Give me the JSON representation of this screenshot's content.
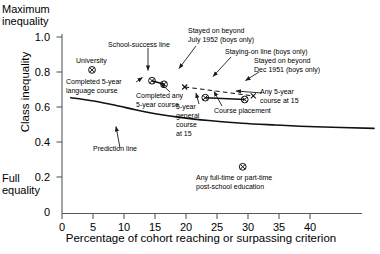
{
  "axes": {
    "top_corner_label": "Maximum\ninequality",
    "bottom_corner_label": "Full\nequality",
    "ylabel": "Class inequality",
    "xlabel": "Percentage of cohort reaching or surpassing criterion",
    "yticks": [
      "1.0",
      "0.8",
      "0.6",
      "0.4",
      "0.2",
      "0"
    ],
    "ytick_values": [
      1.0,
      0.8,
      0.6,
      0.4,
      0.2,
      0
    ],
    "xticks": [
      "0",
      "5",
      "10",
      "15",
      "20",
      "25",
      "30",
      "35",
      "40"
    ],
    "xtick_values": [
      0,
      5,
      10,
      15,
      20,
      25,
      30,
      35,
      40
    ],
    "xlim": [
      0,
      45
    ],
    "ylim": [
      0,
      1.0
    ],
    "grid": "off",
    "axis_color": "#4b5254"
  },
  "annotations": {
    "school_success_line": "School-success line",
    "university": "University",
    "completed_5yr_language": "Completed 5-year\nlanguage course",
    "completed_any_5yr": "Completed any\n5-year course",
    "prediction_line": "Prediction line",
    "stayed_beyond_july_1952": "Stayed on beyond\nJuly 1952 (boys only)",
    "staying_on_line": "Staying-on line (boys only)",
    "stayed_beyond_dec_1951": "Stayed on beyond\nDec 1951 (boys only)",
    "five_year_general_course": "5-year\ngeneral\ncourse\nat 15",
    "course_placement": "Course placement",
    "any_5yr_course_at_15": "Any 5-year\ncourse at 15",
    "post_school_education": "Any full-time or part-time\npost-school education"
  },
  "chart_data": {
    "type": "scatter",
    "title": "",
    "xlabel": "Percentage of cohort reaching or surpassing criterion",
    "ylabel": "Class inequality",
    "xlim": [
      0,
      45
    ],
    "ylim": [
      0,
      1.0
    ],
    "grid": "off",
    "legend_position": "none",
    "points": [
      {
        "label": "University",
        "x": 4.5,
        "y": 0.8,
        "marker": "circled-x"
      },
      {
        "label": "Completed 5-year language course",
        "x": 13.5,
        "y": 0.74,
        "marker": "circled-x"
      },
      {
        "label": "Completed any 5-year course",
        "x": 15.3,
        "y": 0.72,
        "marker": "circled-x"
      },
      {
        "label": "5-year general course at 15",
        "x": 21.5,
        "y": 0.645,
        "marker": "circled-x"
      },
      {
        "label": "Any 5-year course at 15",
        "x": 27.4,
        "y": 0.635,
        "marker": "circled-x"
      },
      {
        "label": "Stayed on beyond July 1952 (boys only)",
        "x": 18.4,
        "y": 0.705,
        "marker": "x"
      },
      {
        "label": "Stayed on beyond Dec 1951 (boys only)",
        "x": 28.7,
        "y": 0.655,
        "marker": "x"
      },
      {
        "label": "Any full-time or part-time post-school education",
        "x": 27.1,
        "y": 0.26,
        "marker": "circled-x"
      }
    ],
    "series": [
      {
        "name": "School-success line",
        "style": "solid",
        "x": [
          13.5,
          15.3
        ],
        "values": [
          0.74,
          0.72
        ]
      },
      {
        "name": "Staying-on line (boys only)",
        "style": "dashed",
        "x": [
          18.4,
          28.7
        ],
        "values": [
          0.705,
          0.655
        ]
      },
      {
        "name": "Course placement",
        "style": "solid",
        "x": [
          21.5,
          27.4
        ],
        "values": [
          0.645,
          0.635
        ]
      },
      {
        "name": "Prediction line",
        "style": "curve",
        "x": [
          1.3,
          3,
          5,
          8,
          11,
          14,
          18,
          22,
          27,
          32,
          38,
          46.8
        ],
        "values": [
          0.645,
          0.637,
          0.625,
          0.603,
          0.578,
          0.556,
          0.534,
          0.518,
          0.503,
          0.493,
          0.483,
          0.474
        ]
      }
    ]
  }
}
